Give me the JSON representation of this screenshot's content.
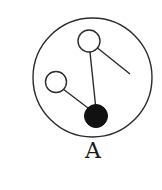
{
  "figure": {
    "label": "A",
    "colors": {
      "stroke": "#2b2b2b",
      "fill_dark": "#111111",
      "fill_light": "#ffffff",
      "background": "#ffffff"
    },
    "outer_circle": {
      "cx": 92.5,
      "cy": 77.5,
      "r": 59.5
    },
    "balls": [
      {
        "name": "upper-open-ball",
        "cx": 89,
        "cy": 41,
        "r": 11,
        "filled": false
      },
      {
        "name": "left-open-ball",
        "cx": 56,
        "cy": 82,
        "r": 10.5,
        "filled": false
      },
      {
        "name": "bottom-filled-ball",
        "cx": 96,
        "cy": 116,
        "r": 11.5,
        "filled": true
      }
    ],
    "lines": [
      {
        "name": "upper-to-bottom-rod",
        "x1": 90,
        "y1": 52,
        "x2": 95.5,
        "y2": 105
      },
      {
        "name": "left-to-bottom-rod",
        "x1": 63,
        "y1": 89,
        "x2": 88,
        "y2": 108
      },
      {
        "name": "upper-right-rod",
        "x1": 97.5,
        "y1": 48,
        "x2": 130,
        "y2": 74
      }
    ]
  }
}
